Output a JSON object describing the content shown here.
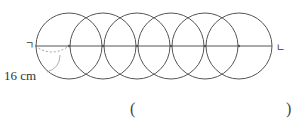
{
  "diagram": {
    "type": "overlapping-circles",
    "circle_count": 6,
    "radius_px": 33,
    "center_y_px": 46,
    "centers_x_px": [
      69,
      103,
      137,
      171,
      205,
      239
    ],
    "line": {
      "x1": 35,
      "x2": 272,
      "y": 46
    },
    "stroke_color": "#555555",
    "dashed_arc_color": "#888888"
  },
  "labels": {
    "left_point": "ㄱ",
    "right_point": "ㄴ",
    "measure": "16 cm"
  },
  "answer": {
    "open_paren": "(",
    "close_paren": ")",
    "value": ""
  }
}
